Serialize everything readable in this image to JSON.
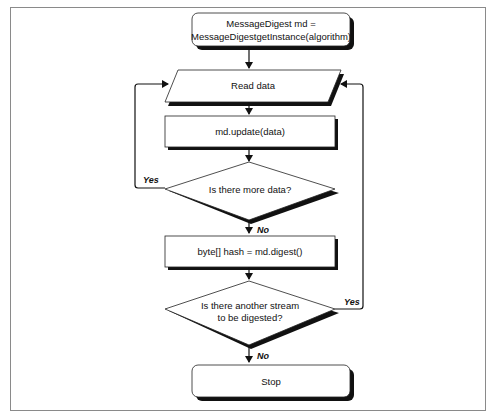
{
  "diagram": {
    "type": "flowchart",
    "nodes": [
      {
        "id": "init",
        "shape": "rounded-rect",
        "lines": [
          "MessageDigest md =",
          "MessageDigestgetInstance(algorithm)"
        ]
      },
      {
        "id": "read",
        "shape": "parallelogram",
        "lines": [
          "Read data"
        ]
      },
      {
        "id": "update",
        "shape": "rect",
        "lines": [
          "md.update(data)"
        ]
      },
      {
        "id": "more",
        "shape": "diamond",
        "lines": [
          "Is there more data?"
        ]
      },
      {
        "id": "digest",
        "shape": "rect",
        "lines": [
          "byte[] hash = md.digest()"
        ]
      },
      {
        "id": "another",
        "shape": "diamond",
        "lines": [
          "Is there another stream",
          "to be digested?"
        ]
      },
      {
        "id": "stop",
        "shape": "rounded-rect",
        "lines": [
          "Stop"
        ]
      }
    ],
    "edges": [
      {
        "from": "init",
        "to": "read",
        "label": ""
      },
      {
        "from": "read",
        "to": "update",
        "label": ""
      },
      {
        "from": "update",
        "to": "more",
        "label": ""
      },
      {
        "from": "more",
        "to": "read",
        "label": "Yes"
      },
      {
        "from": "more",
        "to": "digest",
        "label": "No"
      },
      {
        "from": "digest",
        "to": "another",
        "label": ""
      },
      {
        "from": "another",
        "to": "read",
        "label": "Yes"
      },
      {
        "from": "another",
        "to": "stop",
        "label": "No"
      }
    ],
    "labels": {
      "yes1": "Yes",
      "no1": "No",
      "yes2": "Yes",
      "no2": "No"
    }
  }
}
